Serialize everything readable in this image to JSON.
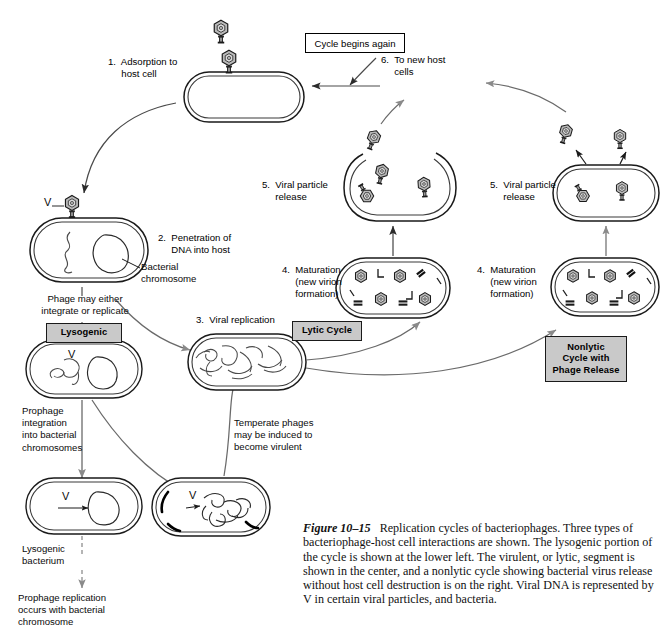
{
  "figure": {
    "number": "Figure 10–15",
    "caption": "Replication cycles of bacteriophages. Three types of bacteriophage-host cell interactions are shown. The lysogenic portion of the cycle is shown at the lower left. The virulent, or lytic, segment is shown in the center, and a nonlytic cycle showing bacterial virus release without host cell destruction is on the right. Viral DNA is represented by V in certain viral particles, and bacteria."
  },
  "steps": {
    "step1": "1.  Adsorption to\n     host cell",
    "step2": "2.  Penetration of\n     DNA into host",
    "step3": "3.  Viral replication",
    "step4_lytic": "4.  Maturation\n     (new virion\n     formation)",
    "step5_lytic": "5.  Viral particle\n     release",
    "step6_lytic": "6.  To new host\n     cells",
    "step4_nonlytic": "4.  Maturation\n     (new virion\n     formation)",
    "step5_nonlytic": "5.  Viral particle\n     release"
  },
  "annotations": {
    "bacterial_chromosome": "Bacterial\nchromosome",
    "phage_choice": "Phage may either\nintegrate or replicate",
    "prophage_integration": "Prophage\nintegration\ninto bacterial\nchromosomes",
    "lysogenic_bacterium": "Lysogenic\nbacterium",
    "prophage_replication": "Prophage replication\noccurs with bacterial\nchromosome",
    "temperate_phages": "Temperate phages\nmay be induced to\nbecome virulent"
  },
  "boxes": {
    "cycle_begins_again": "Cycle begins again",
    "lysogenic": "Lysogenic",
    "lytic_cycle": "Lytic Cycle",
    "nonlytic": "Nonlytic\nCycle with\nPhage Release"
  },
  "viral_dna_marks": {
    "adsorbed_phage_v": "V",
    "lysogenic_cell_v": "V",
    "prophage_cell_v": "V",
    "induced_cell_v": "V"
  },
  "colors": {
    "ink": "#111111",
    "phage_head_fill": "#b9b9b9",
    "box_gray": "#c9c9c9",
    "paper": "#ffffff"
  },
  "icons": {
    "phage": "bacteriophage-icon",
    "cell": "bacterial-cell-icon",
    "lysed_cell": "lysed-cell-icon",
    "arrow": "arrow-icon"
  }
}
